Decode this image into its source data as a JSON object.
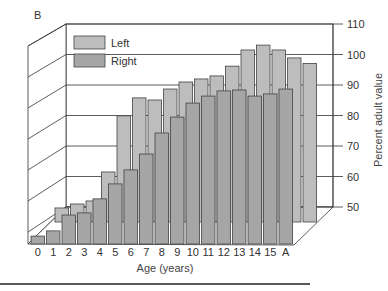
{
  "chart_data": {
    "type": "bar",
    "title": "",
    "xlabel": "Age (years)",
    "ylabel": "Percent adult value",
    "ylim": [
      50,
      110
    ],
    "yticks": [
      50,
      60,
      70,
      80,
      90,
      100,
      110
    ],
    "categories": [
      "0",
      "1",
      "2",
      "3",
      "4",
      "5",
      "6",
      "7",
      "8",
      "9",
      "10",
      "11",
      "12",
      "13",
      "14",
      "15",
      "A"
    ],
    "series": [
      {
        "name": "Left",
        "color": "#bdbdbd",
        "values": [
          54.6,
          55.9,
          56.9,
          66.4,
          84.8,
          90.7,
          90.0,
          93.6,
          95.9,
          96.9,
          97.9,
          101.1,
          106.4,
          108.0,
          106.4,
          103.8,
          102.0
        ]
      },
      {
        "name": "Right",
        "color": "#a6a6a6",
        "values": [
          52.6,
          54.3,
          59.5,
          60.2,
          64.8,
          69.7,
          74.3,
          79.5,
          86.4,
          91.6,
          96.2,
          98.5,
          100.2,
          100.5,
          98.5,
          99.2,
          100.8
        ]
      }
    ],
    "depth_labels": {
      "back": "B",
      "front": "A"
    },
    "legend": {
      "position": "upper-left",
      "entries": [
        "Left",
        "Right"
      ]
    },
    "grid": true,
    "style": "3d-grouped-bars"
  }
}
